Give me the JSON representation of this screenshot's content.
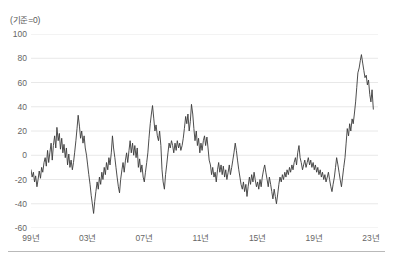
{
  "chart_data": {
    "type": "line",
    "title": "",
    "subtitle": "",
    "axis_note": "(기준=0)",
    "xlabel": "",
    "ylabel": "",
    "ylim": [
      -60,
      100
    ],
    "yticks": [
      100,
      80,
      60,
      40,
      20,
      0,
      -20,
      -40,
      -60
    ],
    "ytick_labels": [
      "100",
      "80",
      "60",
      "40",
      "20",
      "0",
      "-20",
      "-40",
      "-60"
    ],
    "xlim": [
      1999.0,
      2023.5
    ],
    "xticks": [
      1999,
      2003,
      2007,
      2011,
      2015,
      2019,
      2023
    ],
    "xtick_labels": [
      "99년",
      "03년",
      "07년",
      "11년",
      "15년",
      "19년",
      "23년"
    ],
    "grid": true,
    "grid_axis": "y",
    "grid_color": "#e8e8e8",
    "line_color": "#3a3a3a",
    "line_width": 0.9,
    "legend": null,
    "legend_position": "none",
    "baseline_value": 0,
    "series": [
      {
        "name": "지수",
        "x": [
          1999.0,
          1999.08,
          1999.17,
          1999.25,
          1999.33,
          1999.42,
          1999.5,
          1999.58,
          1999.67,
          1999.75,
          1999.83,
          1999.92,
          2000.0,
          2000.08,
          2000.17,
          2000.25,
          2000.33,
          2000.42,
          2000.5,
          2000.58,
          2000.67,
          2000.75,
          2000.83,
          2000.92,
          2001.0,
          2001.08,
          2001.17,
          2001.25,
          2001.33,
          2001.42,
          2001.5,
          2001.58,
          2001.67,
          2001.75,
          2001.83,
          2001.92,
          2002.0,
          2002.08,
          2002.17,
          2002.25,
          2002.33,
          2002.42,
          2002.5,
          2002.58,
          2002.67,
          2002.75,
          2002.83,
          2002.92,
          2003.0,
          2003.08,
          2003.17,
          2003.25,
          2003.33,
          2003.42,
          2003.5,
          2003.58,
          2003.67,
          2003.75,
          2003.83,
          2003.92,
          2004.0,
          2004.08,
          2004.17,
          2004.25,
          2004.33,
          2004.42,
          2004.5,
          2004.58,
          2004.67,
          2004.75,
          2004.83,
          2004.92,
          2005.0,
          2005.08,
          2005.17,
          2005.25,
          2005.33,
          2005.42,
          2005.5,
          2005.58,
          2005.67,
          2005.75,
          2005.83,
          2005.92,
          2006.0,
          2006.08,
          2006.17,
          2006.25,
          2006.33,
          2006.42,
          2006.5,
          2006.58,
          2006.67,
          2006.75,
          2006.83,
          2006.92,
          2007.0,
          2007.08,
          2007.17,
          2007.25,
          2007.33,
          2007.42,
          2007.5,
          2007.58,
          2007.67,
          2007.75,
          2007.83,
          2007.92,
          2008.0,
          2008.08,
          2008.17,
          2008.25,
          2008.33,
          2008.42,
          2008.5,
          2008.58,
          2008.67,
          2008.75,
          2008.83,
          2008.92,
          2009.0,
          2009.08,
          2009.17,
          2009.25,
          2009.33,
          2009.42,
          2009.5,
          2009.58,
          2009.67,
          2009.75,
          2009.83,
          2009.92,
          2010.0,
          2010.08,
          2010.17,
          2010.25,
          2010.33,
          2010.42,
          2010.5,
          2010.58,
          2010.67,
          2010.75,
          2010.83,
          2010.92,
          2011.0,
          2011.08,
          2011.17,
          2011.25,
          2011.33,
          2011.42,
          2011.5,
          2011.58,
          2011.67,
          2011.75,
          2011.83,
          2011.92,
          2012.0,
          2012.08,
          2012.17,
          2012.25,
          2012.33,
          2012.42,
          2012.5,
          2012.58,
          2012.67,
          2012.75,
          2012.83,
          2012.92,
          2013.0,
          2013.08,
          2013.17,
          2013.25,
          2013.33,
          2013.42,
          2013.5,
          2013.58,
          2013.67,
          2013.75,
          2013.83,
          2013.92,
          2014.0,
          2014.08,
          2014.17,
          2014.25,
          2014.33,
          2014.42,
          2014.5,
          2014.58,
          2014.67,
          2014.75,
          2014.83,
          2014.92,
          2015.0,
          2015.08,
          2015.17,
          2015.25,
          2015.33,
          2015.42,
          2015.5,
          2015.58,
          2015.67,
          2015.75,
          2015.83,
          2015.92,
          2016.0,
          2016.08,
          2016.17,
          2016.25,
          2016.33,
          2016.42,
          2016.5,
          2016.58,
          2016.67,
          2016.75,
          2016.83,
          2016.92,
          2017.0,
          2017.08,
          2017.17,
          2017.25,
          2017.33,
          2017.42,
          2017.5,
          2017.58,
          2017.67,
          2017.75,
          2017.83,
          2017.92,
          2018.0,
          2018.08,
          2018.17,
          2018.25,
          2018.33,
          2018.42,
          2018.5,
          2018.58,
          2018.67,
          2018.75,
          2018.83,
          2018.92,
          2019.0,
          2019.08,
          2019.17,
          2019.25,
          2019.33,
          2019.42,
          2019.5,
          2019.58,
          2019.67,
          2019.75,
          2019.83,
          2019.92,
          2020.0,
          2020.08,
          2020.17,
          2020.25,
          2020.33,
          2020.42,
          2020.5,
          2020.58,
          2020.67,
          2020.75,
          2020.83,
          2020.92,
          2021.0,
          2021.08,
          2021.17,
          2021.25,
          2021.33,
          2021.42,
          2021.5,
          2021.58,
          2021.67,
          2021.75,
          2021.83,
          2021.92,
          2022.0,
          2022.08,
          2022.17,
          2022.25,
          2022.33,
          2022.42,
          2022.5,
          2022.58,
          2022.67,
          2022.75,
          2022.83,
          2022.92,
          2023.0,
          2023.08,
          2023.17
        ],
        "values": [
          -12,
          -18,
          -14,
          -22,
          -17,
          -26,
          -20,
          -13,
          -19,
          -10,
          -14,
          -6,
          -2,
          -9,
          4,
          -6,
          2,
          10,
          -4,
          8,
          16,
          6,
          23,
          12,
          18,
          5,
          14,
          2,
          9,
          -2,
          6,
          -8,
          1,
          -10,
          -4,
          -12,
          -6,
          2,
          12,
          22,
          33,
          24,
          14,
          20,
          10,
          16,
          6,
          0,
          -8,
          -16,
          -24,
          -33,
          -40,
          -48,
          -38,
          -30,
          -22,
          -28,
          -18,
          -24,
          -14,
          -20,
          -10,
          -16,
          -6,
          -12,
          -2,
          -8,
          2,
          16,
          6,
          -2,
          -10,
          -18,
          -26,
          -31,
          -20,
          -12,
          -6,
          -14,
          -4,
          2,
          -6,
          4,
          12,
          2,
          10,
          0,
          8,
          -2,
          6,
          -10,
          -3,
          -14,
          -8,
          -18,
          -22,
          -14,
          -6,
          2,
          14,
          26,
          34,
          41,
          30,
          20,
          25,
          16,
          12,
          20,
          8,
          -12,
          -22,
          -28,
          -16,
          -8,
          2,
          10,
          6,
          12,
          8,
          2,
          10,
          4,
          12,
          6,
          10,
          4,
          8,
          14,
          22,
          32,
          26,
          34,
          20,
          28,
          42,
          34,
          22,
          12,
          20,
          8,
          14,
          2,
          10,
          4,
          12,
          16,
          8,
          15,
          6,
          -4,
          -8,
          -16,
          -10,
          -18,
          -14,
          -22,
          -12,
          -6,
          -14,
          -8,
          -16,
          -9,
          -18,
          -12,
          -20,
          -14,
          -8,
          -16,
          -10,
          -4,
          2,
          10,
          4,
          -4,
          -12,
          -18,
          -24,
          -28,
          -22,
          -30,
          -24,
          -34,
          -26,
          -18,
          -24,
          -16,
          -22,
          -14,
          -20,
          -26,
          -22,
          -28,
          -20,
          -26,
          -18,
          -12,
          -8,
          -14,
          -20,
          -26,
          -18,
          -24,
          -30,
          -36,
          -28,
          -34,
          -40,
          -32,
          -24,
          -18,
          -22,
          -16,
          -20,
          -14,
          -18,
          -12,
          -16,
          -10,
          -14,
          -8,
          -12,
          -6,
          -2,
          -8,
          2,
          8,
          -2,
          -6,
          -12,
          -8,
          -4,
          -10,
          -6,
          -2,
          -8,
          -4,
          -10,
          -6,
          -12,
          -8,
          -14,
          -10,
          -16,
          -12,
          -18,
          -14,
          -20,
          -16,
          -22,
          -18,
          -14,
          -20,
          -26,
          -30,
          -24,
          -18,
          -10,
          -2,
          -8,
          -14,
          -20,
          -26,
          -18,
          -10,
          -2,
          10,
          22,
          16,
          26,
          20,
          30,
          26,
          34,
          44,
          56,
          68,
          72,
          78,
          83,
          76,
          70,
          64,
          66,
          58,
          62,
          50,
          44,
          54,
          38
        ]
      }
    ]
  }
}
